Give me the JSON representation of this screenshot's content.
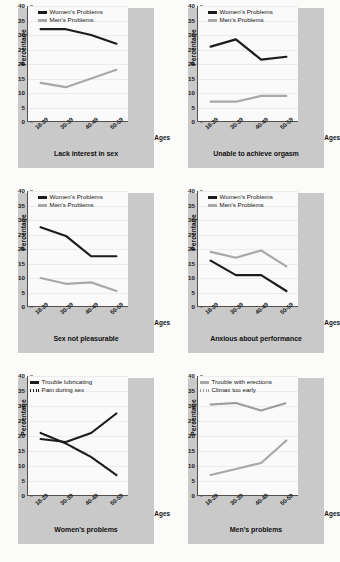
{
  "axes": {
    "ylabel": "Percentage",
    "xlabel": "Ages",
    "yticks": [
      "40",
      "35",
      "30",
      "25",
      "20",
      "15",
      "10",
      "5",
      "0"
    ],
    "ylim": [
      0,
      40
    ],
    "categories": [
      "18-29",
      "30-39",
      "40-49",
      "50-59"
    ]
  },
  "colors": {
    "women": "#1c1c1c",
    "men": "#a8a8a8",
    "panel": "#c9c9c9",
    "plot": "#fafafa",
    "axis": "#55504c",
    "gridline": "#ececec"
  },
  "chart_data": [
    {
      "type": "line",
      "title": "Lack interest in sex",
      "xlabel": "Ages",
      "ylabel": "Percentage",
      "ylim": [
        0,
        40
      ],
      "categories": [
        "18-29",
        "30-39",
        "40-49",
        "50-59"
      ],
      "legend_position": "top-center",
      "grid": true,
      "series": [
        {
          "name": "Women's Problems",
          "style": "solid",
          "color": "#1c1c1c",
          "values": [
            32,
            32,
            30,
            27
          ]
        },
        {
          "name": "Men's Problems",
          "style": "solid",
          "color": "#a8a8a8",
          "values": [
            13.5,
            12,
            15,
            18
          ]
        }
      ]
    },
    {
      "type": "line",
      "title": "Unable to achieve orgasm",
      "xlabel": "Ages",
      "ylabel": "Percentage",
      "ylim": [
        0,
        40
      ],
      "categories": [
        "18-29",
        "30-39",
        "40-49",
        "50-59"
      ],
      "legend_position": "top-center",
      "grid": true,
      "series": [
        {
          "name": "Women's Problems",
          "style": "solid",
          "color": "#1c1c1c",
          "values": [
            26,
            28.5,
            21.5,
            22.5
          ]
        },
        {
          "name": "Men's Problems",
          "style": "solid",
          "color": "#a8a8a8",
          "values": [
            7,
            7,
            9,
            9
          ]
        }
      ]
    },
    {
      "type": "line",
      "title": "Sex not pleasurable",
      "xlabel": "Ages",
      "ylabel": "Percentage",
      "ylim": [
        0,
        40
      ],
      "categories": [
        "18-29",
        "30-39",
        "40-49",
        "50-59"
      ],
      "legend_position": "top-center",
      "grid": true,
      "series": [
        {
          "name": "Women's Problems",
          "style": "solid",
          "color": "#1c1c1c",
          "values": [
            27.5,
            24.5,
            17.5,
            17.5
          ]
        },
        {
          "name": "Men's Problems",
          "style": "solid",
          "color": "#a8a8a8",
          "values": [
            10,
            8,
            8.5,
            5.5
          ]
        }
      ]
    },
    {
      "type": "line",
      "title": "Anxious about performance",
      "xlabel": "Ages",
      "ylabel": "Percentage",
      "ylim": [
        0,
        40
      ],
      "categories": [
        "18-29",
        "30-39",
        "40-49",
        "50-59"
      ],
      "legend_position": "top-center",
      "grid": true,
      "series": [
        {
          "name": "Women's Problems",
          "style": "solid",
          "color": "#1c1c1c",
          "values": [
            16,
            11,
            11,
            5.5
          ]
        },
        {
          "name": "Men's Problems",
          "style": "solid",
          "color": "#a8a8a8",
          "values": [
            19,
            17,
            19.5,
            14
          ]
        }
      ]
    },
    {
      "type": "line",
      "title": "Women's problems",
      "xlabel": "Ages",
      "ylabel": "Percentage",
      "ylim": [
        0,
        40
      ],
      "categories": [
        "18-29",
        "30-39",
        "40-49",
        "50-59"
      ],
      "legend_position": "top-center",
      "grid": true,
      "series": [
        {
          "name": "Trouble lubricating",
          "style": "solid",
          "color": "#1c1c1c",
          "values": [
            19,
            18,
            21,
            27.5
          ]
        },
        {
          "name": "Pain during sex",
          "style": "dotted",
          "color": "#1c1c1c",
          "values": [
            21,
            17.5,
            13,
            7
          ]
        }
      ]
    },
    {
      "type": "line",
      "title": "Men's problems",
      "xlabel": "Ages",
      "ylabel": "Percentage",
      "ylim": [
        0,
        40
      ],
      "categories": [
        "18-29",
        "30-39",
        "40-49",
        "50-59"
      ],
      "legend_position": "top-center",
      "grid": true,
      "series": [
        {
          "name": "Trouble with erections",
          "style": "solid",
          "color": "#a8a8a8",
          "values": [
            7,
            9,
            11,
            18.5
          ]
        },
        {
          "name": "Climax too early",
          "style": "dotted",
          "color": "#9d9d9d",
          "values": [
            30.5,
            31,
            28.5,
            31
          ]
        }
      ]
    }
  ]
}
